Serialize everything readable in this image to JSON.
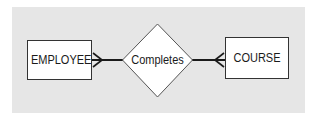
{
  "diagram": {
    "type": "entity-relationship",
    "entities": [
      {
        "id": "employee",
        "label": "EMPLOYEE"
      },
      {
        "id": "course",
        "label": "COURSE"
      }
    ],
    "relationships": [
      {
        "id": "completes",
        "label": "Completes",
        "from": "employee",
        "to": "course",
        "from_cardinality": "many",
        "to_cardinality": "many"
      }
    ],
    "colors": {
      "panel": "#e6e6e6",
      "shape_fill": "#ffffff",
      "stroke": "#1a1a1a"
    }
  }
}
